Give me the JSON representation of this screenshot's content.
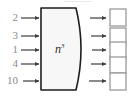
{
  "diagram": {
    "block": {
      "label_base": "n",
      "label_exponent": "3",
      "fill_color": "#f7f7f7",
      "border_color": "#1d1d1d"
    },
    "inputs": [
      {
        "label": "2",
        "y": 18
      },
      {
        "label": "3",
        "y": 36
      },
      {
        "label": "1",
        "y": 50
      },
      {
        "label": "4",
        "y": 64
      },
      {
        "label": "10",
        "y": 81
      }
    ],
    "outputs": [
      {
        "label": "",
        "y": 18
      },
      {
        "label": "",
        "y": 36
      },
      {
        "label": "",
        "y": 50
      },
      {
        "label": "",
        "y": 64
      },
      {
        "label": "",
        "y": 81
      }
    ],
    "colors": {
      "arrow": "#3d3d3d",
      "output_box_border": "#9a9a9a",
      "output_box_fill": "#ffffff",
      "label_text": "#8a8a8a",
      "background": "#ffffff"
    }
  }
}
